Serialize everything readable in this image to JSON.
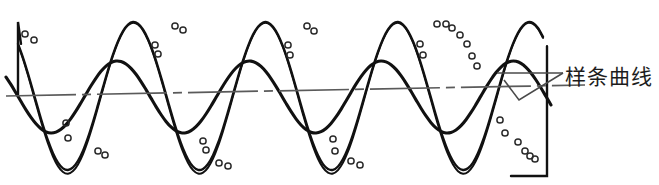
{
  "figure": {
    "title": "",
    "background_color": "#ffffff",
    "width": 659,
    "height": 185,
    "annotation": {
      "label": "样条曲线",
      "label_x": 565,
      "label_y": 64,
      "leader_color": "#4a4a4a",
      "pointer_shape": "open-triangle-wedge"
    },
    "axis_line": {
      "name": "center-dash-dot-line",
      "style": "dash-dot",
      "color": "#5a5a5a",
      "y_left": 96,
      "y_right": 85,
      "x_start": 6,
      "x_end": 585
    },
    "boundaries": [
      {
        "name": "left-edge",
        "x": 18,
        "y_top": 22,
        "y_bottom": 96
      },
      {
        "name": "right-edge",
        "x": 547,
        "y_top": 98,
        "y_bottom": 176
      }
    ],
    "curve_color": "#111111",
    "marker_color": "#2b2b2b"
  },
  "chart_data": {
    "type": "line",
    "title": "样条曲线",
    "xlabel": "",
    "ylabel": "",
    "xlim": [
      0,
      659
    ],
    "ylim": [
      185,
      0
    ],
    "grid": false,
    "legend": "none",
    "annotations": [
      {
        "text": "样条曲线",
        "x": 565,
        "y": 77,
        "leader_to_x": 513,
        "leader_to_y": 86
      }
    ],
    "series": [
      {
        "name": "large-amplitude-spline",
        "style": "solid-thick",
        "color": "#111111",
        "baseline_y": 96,
        "amplitude": 74,
        "wavelength": 132,
        "phase_deg": 86,
        "x_start": 18,
        "x_end": 547
      },
      {
        "name": "small-amplitude-spline",
        "style": "solid-thick",
        "color": "#111111",
        "baseline_y": 97,
        "amplitude": 36,
        "wavelength": 132,
        "phase_deg": 130,
        "x_start": 6,
        "x_end": 553
      }
    ],
    "markers": {
      "name": "data-points",
      "shape": "open-circle",
      "radius": 3.1,
      "color": "#2b2b2b",
      "points": [
        [
          25,
          34
        ],
        [
          34,
          40
        ],
        [
          66,
          123
        ],
        [
          68,
          138
        ],
        [
          98,
          151
        ],
        [
          105,
          155
        ],
        [
          155,
          45
        ],
        [
          158,
          54
        ],
        [
          175,
          26
        ],
        [
          183,
          30
        ],
        [
          203,
          141
        ],
        [
          206,
          150
        ],
        [
          219,
          163
        ],
        [
          228,
          166
        ],
        [
          288,
          45
        ],
        [
          290,
          55
        ],
        [
          307,
          26
        ],
        [
          314,
          31
        ],
        [
          333,
          139
        ],
        [
          335,
          151
        ],
        [
          351,
          161
        ],
        [
          360,
          165
        ],
        [
          420,
          44
        ],
        [
          423,
          55
        ],
        [
          437,
          24
        ],
        [
          446,
          24
        ],
        [
          452,
          28
        ],
        [
          460,
          35
        ],
        [
          467,
          44
        ],
        [
          472,
          56
        ],
        [
          477,
          66
        ],
        [
          500,
          120
        ],
        [
          505,
          133
        ],
        [
          518,
          142
        ],
        [
          525,
          151
        ],
        [
          530,
          156
        ],
        [
          535,
          159
        ]
      ]
    }
  }
}
